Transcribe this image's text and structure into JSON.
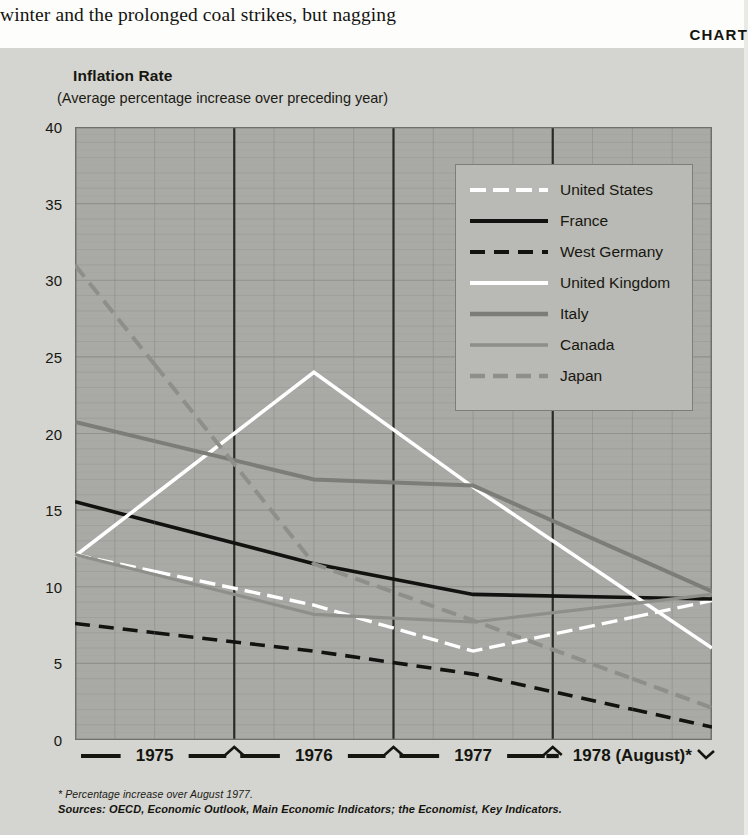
{
  "page": {
    "body_copy": "winter and the prolonged coal strikes, but nagging",
    "chart_kicker": "CHART"
  },
  "chart_data": {
    "type": "line",
    "title": "Inflation Rate",
    "subtitle": "(Average percentage increase over preceding year)",
    "xlabel": "",
    "ylabel": "",
    "ylim": [
      0,
      40
    ],
    "yticks": [
      0,
      5,
      10,
      15,
      20,
      25,
      30,
      35,
      40
    ],
    "grid": true,
    "legend_position": "upper-right",
    "categories": [
      "1975",
      "1976",
      "1977",
      "1978 (August)*"
    ],
    "series": [
      {
        "name": "United States",
        "style": "dash-dot-white",
        "color": "#ffffff",
        "values": [
          11.0,
          8.8,
          5.8,
          8.0
        ]
      },
      {
        "name": "France",
        "style": "solid-black",
        "color": "#121210",
        "values": [
          14.2,
          11.5,
          9.5,
          9.3
        ]
      },
      {
        "name": "West Germany",
        "style": "dashed-black",
        "color": "#121210",
        "values": [
          7.0,
          5.8,
          4.3,
          2.0
        ]
      },
      {
        "name": "United Kingdom",
        "style": "solid-white",
        "color": "#ffffff",
        "values": [
          16.0,
          24.0,
          16.5,
          9.5
        ]
      },
      {
        "name": "Italy",
        "style": "solid-gray-dark",
        "color": "#7c7c78",
        "values": [
          19.5,
          17.0,
          16.6,
          12.0
        ]
      },
      {
        "name": "Canada",
        "style": "solid-gray-mid",
        "color": "#8e8e8a",
        "values": [
          10.8,
          8.2,
          7.7,
          8.9
        ]
      },
      {
        "name": "Japan",
        "style": "dashed-gray",
        "color": "#8e8e8a",
        "values": [
          24.5,
          11.5,
          7.8,
          4.0
        ]
      }
    ],
    "annotations": []
  },
  "footnotes": {
    "note": "* Percentage increase over August 1977.",
    "sources": "Sources: OECD, Economic Outlook, Main Economic Indicators; the Economist, Key Indicators."
  }
}
